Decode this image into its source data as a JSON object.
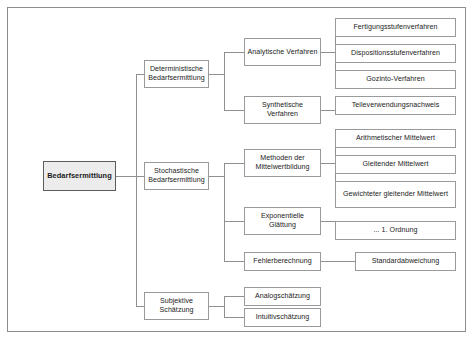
{
  "diagram": {
    "title": "Bedarfsermittlung",
    "type": "hierarchy-tree",
    "orientation": "left-to-right",
    "border_color": "#8d8d8d",
    "node_border_color": "#9a9a9a",
    "root_fill_color": "#ececed",
    "connector_color": "#8f8f8f"
  },
  "nodes": {
    "root": {
      "label": "Bedarfsermittlung",
      "level": 1
    },
    "l2": [
      {
        "id": "deterministisch",
        "label": "Deterministische Bedarfsermittlung",
        "level": 2
      },
      {
        "id": "stochastisch",
        "label": "Stochastische Bedarfsermittlung",
        "level": 2
      },
      {
        "id": "subjektiv",
        "label": "Subjektive Schätzung",
        "level": 2
      }
    ],
    "l3": [
      {
        "id": "analytische",
        "label": "Analytische Verfahren",
        "level": 3,
        "parent": "deterministisch"
      },
      {
        "id": "synthetische",
        "label": "Synthetische Verfahren",
        "level": 3,
        "parent": "deterministisch"
      },
      {
        "id": "mittelwert",
        "label": "Methoden der Mittelwertbildung",
        "level": 3,
        "parent": "stochastisch"
      },
      {
        "id": "exponentielle",
        "label": "Exponentielle Glättung",
        "level": 3,
        "parent": "stochastisch"
      },
      {
        "id": "fehler",
        "label": "Fehlerberechnung",
        "level": 3,
        "parent": "stochastisch"
      },
      {
        "id": "analog",
        "label": "Analogschätzung",
        "level": 3,
        "parent": "subjektiv"
      },
      {
        "id": "intuitiv",
        "label": "Intuitivschätzung",
        "level": 3,
        "parent": "subjektiv"
      }
    ],
    "l4": [
      {
        "id": "fertigungsstufen",
        "label": "Fertigungsstufenverfahren",
        "level": 4,
        "parent": "analytische"
      },
      {
        "id": "dispositionsstufen",
        "label": "Dispositionsstufenverfahren",
        "level": 4,
        "parent": "analytische"
      },
      {
        "id": "gozinto",
        "label": "Gozinto-Verfahren",
        "level": 4,
        "parent": "analytische"
      },
      {
        "id": "teileverwendung",
        "label": "Teileverwendungsnachweis",
        "level": 4,
        "parent": "synthetische"
      },
      {
        "id": "arithmetisch",
        "label": "Arithmetischer Mittelwert",
        "level": 4,
        "parent": "mittelwert"
      },
      {
        "id": "gleitend",
        "label": "Gleitender Mittelwert",
        "level": 4,
        "parent": "mittelwert"
      },
      {
        "id": "gewichtet",
        "label": "Gewichteter gleitender Mittelwert",
        "level": 4,
        "parent": "mittelwert"
      },
      {
        "id": "ordnung",
        "label": "... 1. Ordnung",
        "level": 4,
        "parent": "exponentielle"
      },
      {
        "id": "standardabweichung",
        "label": "Standardabweichung",
        "level": 4,
        "parent": "fehler"
      }
    ]
  }
}
